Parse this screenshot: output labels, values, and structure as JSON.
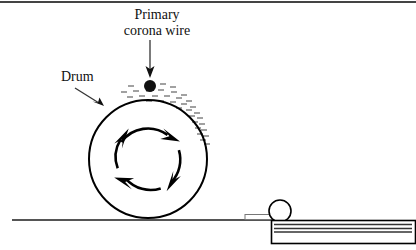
{
  "figure": {
    "background_color": "#ffffff",
    "line_color": "#000000",
    "charge_mark_color": "#808080",
    "top_border_color": "#444444"
  },
  "labels": {
    "corona_wire": {
      "line1": "Primary",
      "line2": "corona wire",
      "name": "primary-corona-wire-label"
    },
    "drum": {
      "text": "Drum",
      "name": "drum-label"
    }
  },
  "parts": {
    "drum": {
      "name": "drum",
      "center_x": 148,
      "center_y": 159,
      "radius": 59
    },
    "rotation_indicator": {
      "name": "rotation-arrows",
      "direction": "clockwise",
      "center_x": 148,
      "center_y": 159,
      "radius": 33,
      "arrow_count": 4
    },
    "corona_wire_dot": {
      "name": "corona-wire-dot",
      "center_x": 150,
      "center_y": 86,
      "radius": 6
    },
    "charge_marks": {
      "name": "charge-marks",
      "count": 34
    },
    "baseline": {
      "name": "ground-baseline",
      "x1": 12,
      "x2": 272,
      "y": 220
    },
    "feed_roller": {
      "name": "feed-roller",
      "center_x": 280,
      "center_y": 211,
      "radius": 11
    },
    "paper_sheet": {
      "name": "paper-sheet",
      "x": 245,
      "y": 214,
      "width": 30,
      "height": 5
    },
    "paper_tray": {
      "name": "paper-tray",
      "x": 271,
      "y": 220,
      "width": 145,
      "height": 24,
      "stack_lines": 3
    }
  }
}
